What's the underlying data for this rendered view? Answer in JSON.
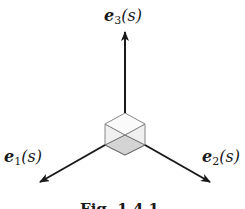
{
  "figure": {
    "labels": {
      "e3": {
        "base": "e",
        "sub": "3",
        "arg": "(s)"
      },
      "e1": {
        "base": "e",
        "sub": "1",
        "arg": "(s)"
      },
      "e2": {
        "base": "e",
        "sub": "2",
        "arg": "(s)"
      }
    },
    "caption": "Fig. 1.4.1",
    "colors": {
      "arrow": "#1a1a1a",
      "cube_edge": "#888888",
      "cube_bottom": "#d4d4d4",
      "cube_sides": "#f0f0f0"
    }
  }
}
